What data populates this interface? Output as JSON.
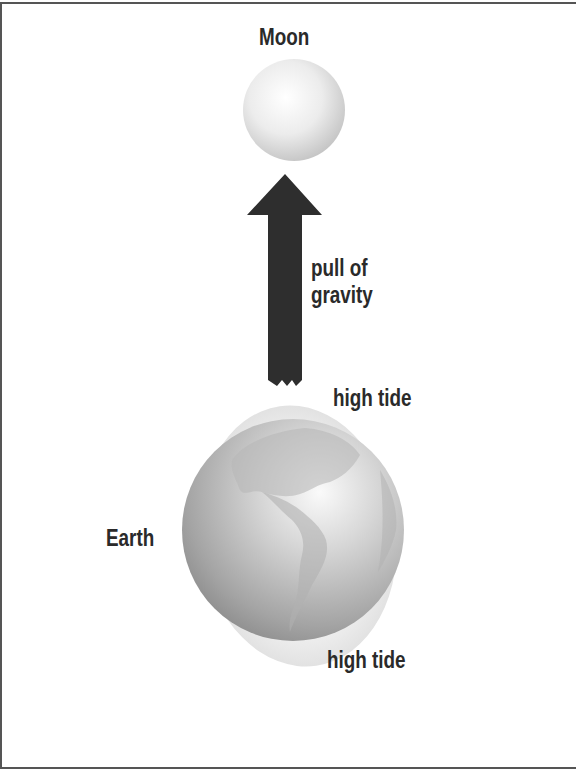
{
  "diagram": {
    "labels": {
      "moon": "Moon",
      "pull_line1": "pull of",
      "pull_line2": "gravity",
      "high_tide_top": "high tide",
      "high_tide_bottom": "high tide",
      "earth": "Earth"
    },
    "colors": {
      "arrow": "#2e2e2e",
      "text": "#2a2a2a",
      "frame": "#555555",
      "moon_light": "#ffffff",
      "moon_dark": "#c8c8c8",
      "earth_light": "#f4f4f4",
      "earth_dark": "#8c8c8c",
      "tide_bulge": "#ededed"
    },
    "icons": {
      "moon": "moon-sphere",
      "earth": "earth-globe",
      "arrow": "gravity-arrow-up"
    }
  }
}
